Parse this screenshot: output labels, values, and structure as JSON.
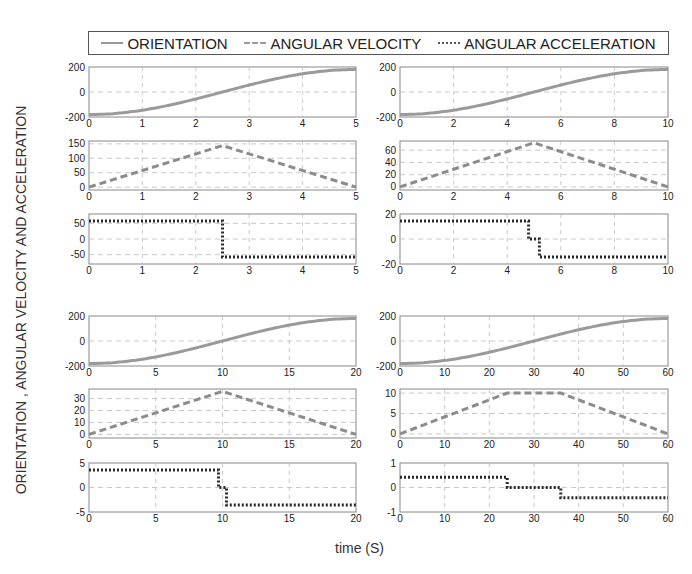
{
  "legend": {
    "items": [
      {
        "label": "ORIENTATION",
        "style": "solid",
        "color": "#9a9a9a"
      },
      {
        "label": "ANGULAR VELOCITY",
        "style": "dashed",
        "color": "#8c8c8c"
      },
      {
        "label": "ANGULAR ACCELERATION",
        "style": "dotted",
        "color": "#333333"
      }
    ]
  },
  "ylabel": "ORIENTATION , ANGULAR VELOCITY AND ACCELERATION",
  "xlabel": "time (S)",
  "chart_data": [
    {
      "type": "line",
      "group": "top-left",
      "title": "",
      "xlabel": "",
      "ylabel": "",
      "x": [
        0,
        1,
        2,
        2.5,
        3,
        4,
        5
      ],
      "xlim": [
        0,
        5
      ],
      "xticks": [
        0,
        1,
        2,
        3,
        4,
        5
      ],
      "series": [
        {
          "name": "ORIENTATION",
          "values": [
            -180,
            -151,
            -65,
            0,
            65,
            151,
            180
          ]
        }
      ],
      "ylim": [
        -200,
        200
      ],
      "yticks": [
        -200,
        0,
        200
      ],
      "grid": true
    },
    {
      "type": "line",
      "group": "top-left",
      "xlim": [
        0,
        5
      ],
      "xticks": [
        0,
        1,
        2,
        3,
        4,
        5
      ],
      "x": [
        0,
        2.5,
        5
      ],
      "series": [
        {
          "name": "ANGULAR VELOCITY",
          "values": [
            0,
            144,
            0
          ]
        }
      ],
      "ylim": [
        -10,
        160
      ],
      "yticks": [
        0,
        50,
        100,
        150
      ],
      "grid": true
    },
    {
      "type": "line",
      "group": "top-left",
      "xlim": [
        0,
        5
      ],
      "xticks": [
        0,
        1,
        2,
        3,
        4,
        5
      ],
      "x": [
        0,
        2.5,
        2.5,
        5
      ],
      "series": [
        {
          "name": "ANGULAR ACCELERATION",
          "values": [
            57.6,
            57.6,
            -57.6,
            -57.6
          ]
        }
      ],
      "ylim": [
        -80,
        80
      ],
      "yticks": [
        -50,
        0,
        50
      ],
      "grid": true
    },
    {
      "type": "line",
      "group": "top-right",
      "xlim": [
        0,
        10
      ],
      "xticks": [
        0,
        2,
        4,
        6,
        8,
        10
      ],
      "x": [
        0,
        2,
        4,
        5,
        6,
        8,
        10
      ],
      "series": [
        {
          "name": "ORIENTATION",
          "values": [
            -180,
            -151,
            -65,
            0,
            65,
            151,
            180
          ]
        }
      ],
      "ylim": [
        -200,
        200
      ],
      "yticks": [
        -200,
        0,
        200
      ],
      "grid": true
    },
    {
      "type": "line",
      "group": "top-right",
      "xlim": [
        0,
        10
      ],
      "xticks": [
        0,
        2,
        4,
        6,
        8,
        10
      ],
      "x": [
        0,
        5,
        10
      ],
      "series": [
        {
          "name": "ANGULAR VELOCITY",
          "values": [
            0,
            72,
            0
          ]
        }
      ],
      "ylim": [
        -5,
        75
      ],
      "yticks": [
        0,
        20,
        40,
        60
      ],
      "grid": true
    },
    {
      "type": "line",
      "group": "top-right",
      "xlim": [
        0,
        10
      ],
      "xticks": [
        0,
        2,
        4,
        6,
        8,
        10
      ],
      "x": [
        0,
        4.8,
        4.8,
        5.2,
        5.2,
        10
      ],
      "series": [
        {
          "name": "ANGULAR ACCELERATION",
          "values": [
            14.4,
            14.4,
            0,
            0,
            -14.4,
            -14.4
          ]
        }
      ],
      "ylim": [
        -20,
        20
      ],
      "yticks": [
        -20,
        0,
        20
      ],
      "grid": true
    },
    {
      "type": "line",
      "group": "bottom-left",
      "xlim": [
        0,
        20
      ],
      "xticks": [
        0,
        5,
        10,
        15,
        20
      ],
      "x": [
        0,
        5,
        10,
        15,
        20
      ],
      "series": [
        {
          "name": "ORIENTATION",
          "values": [
            -180,
            -135,
            0,
            135,
            180
          ]
        }
      ],
      "ylim": [
        -200,
        200
      ],
      "yticks": [
        -200,
        0,
        200
      ],
      "grid": true
    },
    {
      "type": "line",
      "group": "bottom-left",
      "xlim": [
        0,
        20
      ],
      "xticks": [
        0,
        5,
        10,
        15,
        20
      ],
      "x": [
        0,
        10,
        20
      ],
      "series": [
        {
          "name": "ANGULAR VELOCITY",
          "values": [
            0,
            36,
            0
          ]
        }
      ],
      "ylim": [
        -3,
        38
      ],
      "yticks": [
        0,
        10,
        20,
        30
      ],
      "grid": true
    },
    {
      "type": "line",
      "group": "bottom-left",
      "xlim": [
        0,
        20
      ],
      "xticks": [
        0,
        5,
        10,
        15,
        20
      ],
      "x": [
        0,
        9.7,
        9.7,
        10.3,
        10.3,
        20
      ],
      "series": [
        {
          "name": "ANGULAR ACCELERATION",
          "values": [
            3.6,
            3.6,
            0,
            0,
            -3.6,
            -3.6
          ]
        }
      ],
      "ylim": [
        -5,
        5
      ],
      "yticks": [
        -5,
        0,
        5
      ],
      "grid": true
    },
    {
      "type": "line",
      "group": "bottom-right",
      "xlim": [
        0,
        60
      ],
      "xticks": [
        0,
        10,
        20,
        30,
        40,
        50,
        60
      ],
      "x": [
        0,
        10,
        20,
        30,
        40,
        50,
        60
      ],
      "series": [
        {
          "name": "ORIENTATION",
          "values": [
            -180,
            -160,
            -100,
            0,
            100,
            160,
            180
          ]
        }
      ],
      "ylim": [
        -200,
        200
      ],
      "yticks": [
        -200,
        0,
        200
      ],
      "grid": true
    },
    {
      "type": "line",
      "group": "bottom-right",
      "xlim": [
        0,
        60
      ],
      "xticks": [
        0,
        10,
        20,
        30,
        40,
        50,
        60
      ],
      "x": [
        0,
        24,
        36,
        60
      ],
      "series": [
        {
          "name": "ANGULAR VELOCITY",
          "values": [
            0,
            10,
            10,
            0
          ]
        }
      ],
      "ylim": [
        -1,
        11
      ],
      "yticks": [
        0,
        5,
        10
      ],
      "grid": true
    },
    {
      "type": "line",
      "group": "bottom-right",
      "xlim": [
        0,
        60
      ],
      "xticks": [
        0,
        10,
        20,
        30,
        40,
        50,
        60
      ],
      "x": [
        0,
        24,
        24,
        36,
        36,
        60
      ],
      "series": [
        {
          "name": "ANGULAR ACCELERATION",
          "values": [
            0.42,
            0.42,
            0,
            0,
            -0.42,
            -0.42
          ]
        }
      ],
      "ylim": [
        -1,
        1
      ],
      "yticks": [
        -1,
        0,
        1
      ],
      "grid": true
    }
  ]
}
